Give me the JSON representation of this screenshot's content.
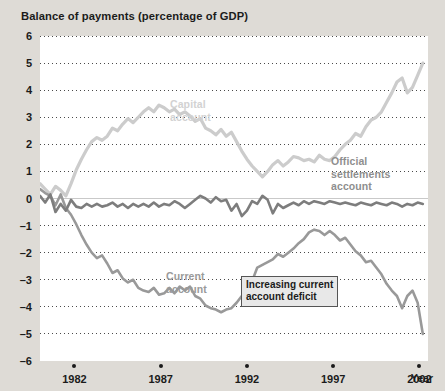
{
  "chart_data": {
    "type": "line",
    "title": "Balance of payments (percentage of GDP)",
    "xlabel": "Year",
    "ylabel": "",
    "xlim": [
      1980,
      2002.5
    ],
    "ylim": [
      -6,
      6
    ],
    "grid": true,
    "legend_position": "in-plot annotations",
    "xticks": [
      "1982",
      "1987",
      "1992",
      "1997",
      "2002"
    ],
    "xtick_values": [
      1982,
      1987,
      1992,
      1997,
      2002
    ],
    "yticks": [
      "6",
      "5",
      "4",
      "3",
      "2",
      "1",
      "0",
      "–1",
      "–2",
      "–3",
      "–4",
      "–5",
      "–6"
    ],
    "ytick_values": [
      6,
      5,
      4,
      3,
      2,
      1,
      0,
      -1,
      -2,
      -3,
      -4,
      -5,
      -6
    ],
    "annotations": [
      {
        "name": "capital-account-label",
        "text_lines": [
          "Capital",
          "account"
        ],
        "color": "#d2d2d2"
      },
      {
        "name": "current-account-label",
        "text_lines": [
          "Current",
          "account"
        ],
        "color": "#9a9a9a"
      },
      {
        "name": "official-settlements-label",
        "text_lines": [
          "Official",
          "settlements",
          "account"
        ],
        "color": "#8e8e8e"
      },
      {
        "name": "increasing-deficit-callout",
        "text_lines": [
          "Increasing current",
          "account deficit"
        ],
        "color": "#1b1b1b"
      }
    ],
    "series": [
      {
        "name": "Capital account",
        "color": "#cccccc",
        "x": [
          1980.0,
          1980.3,
          1980.6,
          1980.9,
          1981.2,
          1981.5,
          1981.8,
          1982.1,
          1982.4,
          1982.7,
          1983.0,
          1983.3,
          1983.6,
          1983.9,
          1984.2,
          1984.5,
          1984.8,
          1985.1,
          1985.4,
          1985.7,
          1986.0,
          1986.3,
          1986.6,
          1986.9,
          1987.2,
          1987.5,
          1987.8,
          1988.1,
          1988.4,
          1988.7,
          1989.0,
          1989.3,
          1989.6,
          1989.9,
          1990.2,
          1990.5,
          1990.8,
          1991.1,
          1991.4,
          1991.7,
          1992.0,
          1992.3,
          1992.6,
          1992.9,
          1993.2,
          1993.5,
          1993.8,
          1994.1,
          1994.4,
          1994.7,
          1995.0,
          1995.3,
          1995.6,
          1995.9,
          1996.2,
          1996.5,
          1996.8,
          1997.1,
          1997.4,
          1997.7,
          1998.0,
          1998.3,
          1998.6,
          1998.9,
          1999.2,
          1999.5,
          1999.8,
          2000.1,
          2000.4,
          2000.7,
          2001.0,
          2001.3,
          2001.6,
          2001.9,
          2002.2
        ],
        "values": [
          0.55,
          0.35,
          0.15,
          0.45,
          0.3,
          0.1,
          0.55,
          1.05,
          1.45,
          1.8,
          2.1,
          2.25,
          2.15,
          2.3,
          2.6,
          2.5,
          2.75,
          2.95,
          2.8,
          3.0,
          3.2,
          3.35,
          3.2,
          3.45,
          3.35,
          3.2,
          3.3,
          3.1,
          3.2,
          3.05,
          2.85,
          2.95,
          2.6,
          2.5,
          2.35,
          2.55,
          2.3,
          2.45,
          2.1,
          1.75,
          1.45,
          1.2,
          1.0,
          0.8,
          1.0,
          1.25,
          1.4,
          1.2,
          1.35,
          1.55,
          1.5,
          1.4,
          1.45,
          1.35,
          1.6,
          1.45,
          1.4,
          1.55,
          1.8,
          2.0,
          2.15,
          2.4,
          2.3,
          2.65,
          2.9,
          3.0,
          3.2,
          3.55,
          3.9,
          4.3,
          4.45,
          3.9,
          4.1,
          4.55,
          5.0
        ]
      },
      {
        "name": "Current account",
        "color": "#999999",
        "x": [
          1980.0,
          1980.3,
          1980.6,
          1980.9,
          1981.2,
          1981.5,
          1981.8,
          1982.1,
          1982.4,
          1982.7,
          1983.0,
          1983.3,
          1983.6,
          1983.9,
          1984.2,
          1984.5,
          1984.8,
          1985.1,
          1985.4,
          1985.7,
          1986.0,
          1986.3,
          1986.6,
          1986.9,
          1987.2,
          1987.5,
          1987.8,
          1988.1,
          1988.4,
          1988.7,
          1989.0,
          1989.3,
          1989.6,
          1989.9,
          1990.2,
          1990.5,
          1990.8,
          1991.1,
          1991.4,
          1991.7,
          1992.0,
          1992.3,
          1992.6,
          1992.9,
          1993.2,
          1993.5,
          1993.8,
          1994.1,
          1994.4,
          1994.7,
          1995.0,
          1995.3,
          1995.6,
          1995.9,
          1996.2,
          1996.5,
          1996.8,
          1997.1,
          1997.4,
          1997.7,
          1998.0,
          1998.3,
          1998.6,
          1998.9,
          1999.2,
          1999.5,
          1999.8,
          2000.1,
          2000.4,
          2000.7,
          2001.0,
          2001.3,
          2001.6,
          2001.9,
          2002.2
        ],
        "values": [
          0.35,
          0.2,
          0.1,
          -0.25,
          0.15,
          -0.35,
          -0.6,
          -0.95,
          -1.35,
          -1.7,
          -2.0,
          -2.2,
          -2.1,
          -2.4,
          -2.75,
          -2.65,
          -2.95,
          -3.1,
          -3.0,
          -3.3,
          -3.4,
          -3.45,
          -3.3,
          -3.55,
          -3.5,
          -3.3,
          -3.5,
          -3.25,
          -3.4,
          -3.25,
          -3.6,
          -3.7,
          -3.95,
          -4.05,
          -4.1,
          -4.2,
          -4.1,
          -4.05,
          -3.85,
          -3.6,
          -3.55,
          -3.05,
          -2.55,
          -2.45,
          -2.35,
          -2.25,
          -2.05,
          -2.15,
          -2.0,
          -1.85,
          -1.65,
          -1.5,
          -1.25,
          -1.15,
          -1.2,
          -1.35,
          -1.2,
          -1.35,
          -1.55,
          -1.45,
          -1.7,
          -1.95,
          -2.1,
          -2.35,
          -2.3,
          -2.55,
          -2.8,
          -3.15,
          -3.4,
          -3.6,
          -4.05,
          -3.6,
          -3.4,
          -3.85,
          -5.0
        ]
      },
      {
        "name": "Official settlements account",
        "color": "#7d7d7d",
        "x": [
          1980.0,
          1980.3,
          1980.6,
          1980.9,
          1981.2,
          1981.5,
          1981.8,
          1982.1,
          1982.4,
          1982.7,
          1983.0,
          1983.3,
          1983.6,
          1983.9,
          1984.2,
          1984.5,
          1984.8,
          1985.1,
          1985.4,
          1985.7,
          1986.0,
          1986.3,
          1986.6,
          1986.9,
          1987.2,
          1987.5,
          1987.8,
          1988.1,
          1988.4,
          1988.7,
          1989.0,
          1989.3,
          1989.6,
          1989.9,
          1990.2,
          1990.5,
          1990.8,
          1991.1,
          1991.4,
          1991.7,
          1992.0,
          1992.3,
          1992.6,
          1992.9,
          1993.2,
          1993.5,
          1993.8,
          1994.1,
          1994.4,
          1994.7,
          1995.0,
          1995.3,
          1995.6,
          1995.9,
          1996.2,
          1996.5,
          1996.8,
          1997.1,
          1997.4,
          1997.7,
          1998.0,
          1998.3,
          1998.6,
          1998.9,
          1999.2,
          1999.5,
          1999.8,
          2000.1,
          2000.4,
          2000.7,
          2001.0,
          2001.3,
          2001.6,
          2001.9,
          2002.2
        ],
        "values": [
          0.1,
          -0.15,
          0.15,
          -0.5,
          -0.2,
          -0.45,
          -0.05,
          -0.3,
          -0.35,
          -0.2,
          -0.3,
          -0.2,
          -0.3,
          -0.25,
          -0.15,
          -0.3,
          -0.2,
          -0.35,
          -0.2,
          -0.3,
          -0.2,
          -0.3,
          -0.15,
          -0.3,
          -0.2,
          -0.25,
          -0.1,
          -0.2,
          -0.35,
          -0.2,
          -0.05,
          0.1,
          0.0,
          -0.15,
          0.05,
          -0.1,
          -0.05,
          -0.45,
          -0.2,
          -0.65,
          -0.45,
          -0.1,
          -0.2,
          0.1,
          -0.05,
          -0.55,
          -0.2,
          -0.35,
          -0.25,
          -0.15,
          -0.25,
          -0.1,
          -0.2,
          -0.1,
          -0.15,
          -0.2,
          -0.1,
          -0.15,
          -0.2,
          -0.15,
          -0.2,
          -0.25,
          -0.15,
          -0.2,
          -0.25,
          -0.15,
          -0.2,
          -0.25,
          -0.15,
          -0.2,
          -0.3,
          -0.2,
          -0.25,
          -0.15,
          -0.2
        ]
      }
    ]
  },
  "labels": {
    "capital": [
      "Capital",
      "account"
    ],
    "current": [
      "Current",
      "account"
    ],
    "official": [
      "Official",
      "settlements",
      "account"
    ],
    "callout": [
      "Increasing current",
      "account deficit"
    ]
  }
}
